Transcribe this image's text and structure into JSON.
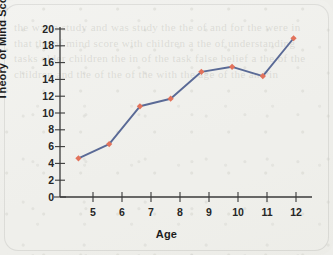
{
  "chart_data": {
    "type": "line",
    "title": "",
    "xlabel": "Age",
    "ylabel": "Theory of Mind Score",
    "x": [
      5,
      6,
      7,
      8,
      9,
      10,
      11,
      12
    ],
    "values": [
      4.6,
      6.3,
      10.8,
      11.7,
      14.9,
      15.5,
      14.4,
      18.9
    ],
    "xtick_labels": [
      "5",
      "6",
      "7",
      "8",
      "9",
      "10",
      "11",
      "12"
    ],
    "ytick_labels": [
      "0",
      "2",
      "4",
      "6",
      "8",
      "10",
      "12",
      "14",
      "16",
      "18",
      "20"
    ],
    "ytick_values": [
      0,
      2,
      4,
      6,
      8,
      10,
      12,
      14,
      16,
      18,
      20
    ],
    "xlim": [
      4.4,
      12.6
    ],
    "ylim": [
      0,
      20
    ],
    "grid": false,
    "legend": false,
    "line_color": "#5a6a96",
    "marker_color": "#e2725b",
    "marker_shape": "diamond",
    "axis_color": "#3a3a3a",
    "background_color": "#efefeb"
  },
  "figure": {
    "ghost_text": "the was a study and was study the the of and for the were in that the of mind score with children a the of understanding tasks older children the in of the task false belief a the of the children and the of the of the with the age of the and in"
  }
}
